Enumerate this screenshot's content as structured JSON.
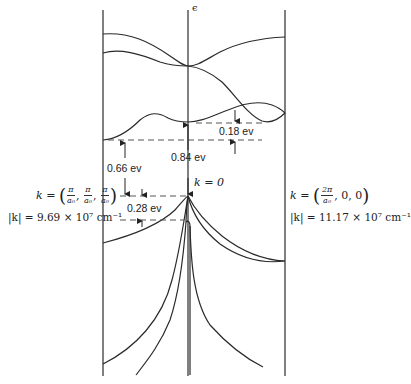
{
  "diagram": {
    "type": "band-structure",
    "axis_label": "ϵ",
    "center_label": "k = 0",
    "left_boundary": {
      "k_label": "k =",
      "components": [
        {
          "num": "π",
          "den": "a₀"
        },
        {
          "num": "π",
          "den": "a₀"
        },
        {
          "num": "π",
          "den": "a₀"
        }
      ],
      "magnitude_label": "|k| = 9.69 × 10⁷ cm⁻¹"
    },
    "right_boundary": {
      "k_label": "k =",
      "components_text": ", 0, 0",
      "first_component": {
        "num": "2π",
        "den": "a₀"
      },
      "magnitude_label": "|k| = 11.17 × 10⁷ cm⁻¹"
    },
    "annotations": [
      {
        "id": "gap_0_18",
        "text": "0.18 ev"
      },
      {
        "id": "gap_0_84",
        "text": "0.84 ev"
      },
      {
        "id": "gap_0_66",
        "text": "0.66 ev"
      },
      {
        "id": "gap_0_28",
        "text": "0.28 ev"
      }
    ],
    "line_color": "#2a2a2a",
    "dash_color": "#555555"
  }
}
